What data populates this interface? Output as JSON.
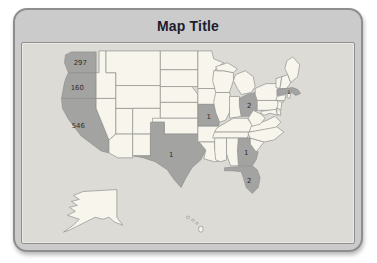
{
  "title": "Map Title",
  "map": {
    "highlight_color": "#a3a3a1",
    "state_fill": "#f7f5ec",
    "border_color": "#8f9190",
    "panel_background": "#dcdbd5",
    "frame_background": "#cbcbcb",
    "states": [
      {
        "id": "WA",
        "name": "Washington",
        "value": "297",
        "highlighted": true
      },
      {
        "id": "OR",
        "name": "Oregon",
        "value": "160",
        "highlighted": true
      },
      {
        "id": "CA",
        "name": "California",
        "value": "546",
        "highlighted": true
      },
      {
        "id": "TX",
        "name": "Texas",
        "value": "1",
        "highlighted": true
      },
      {
        "id": "MO",
        "name": "Missouri",
        "value": "1",
        "highlighted": true
      },
      {
        "id": "OH",
        "name": "Ohio",
        "value": "2",
        "highlighted": true
      },
      {
        "id": "MA",
        "name": "Massachusetts",
        "value": "1",
        "highlighted": true
      },
      {
        "id": "GA",
        "name": "Georgia",
        "value": "1",
        "highlighted": true
      },
      {
        "id": "FL",
        "name": "Florida",
        "value": "2",
        "highlighted": true
      }
    ]
  }
}
